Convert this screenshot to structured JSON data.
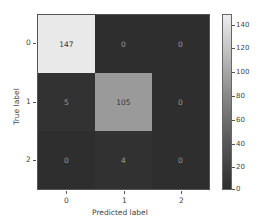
{
  "chart_data": {
    "type": "heatmap",
    "title": "",
    "xlabel": "Predicted label",
    "ylabel": "True label",
    "x_ticks": [
      "0",
      "1",
      "2"
    ],
    "y_ticks": [
      "0",
      "1",
      "2"
    ],
    "matrix": [
      [
        147,
        0,
        0
      ],
      [
        5,
        105,
        0
      ],
      [
        0,
        4,
        0
      ]
    ],
    "colorbar": {
      "min": 0,
      "max": 147,
      "ticks": [
        "0",
        "20",
        "40",
        "60",
        "80",
        "100",
        "120",
        "140"
      ]
    },
    "grid": false
  },
  "cells": [
    {
      "v": "147",
      "bg": "#e9e9e9",
      "fg": "#333333"
    },
    {
      "v": "0",
      "bg": "#2e2e2e",
      "fg": "#9a9a9a"
    },
    {
      "v": "0",
      "bg": "#2e2e2e",
      "fg": "#9a9a9a"
    },
    {
      "v": "5",
      "bg": "#323232",
      "fg": "#9a9a9a"
    },
    {
      "v": "105",
      "bg": "#9a9a9a",
      "fg": "#333333"
    },
    {
      "v": "0",
      "bg": "#2e2e2e",
      "fg": "#9a9a9a"
    },
    {
      "v": "0",
      "bg": "#2e2e2e",
      "fg": "#9a9a9a"
    },
    {
      "v": "4",
      "bg": "#313131",
      "fg": "#9a9a9a"
    },
    {
      "v": "0",
      "bg": "#2e2e2e",
      "fg": "#9a9a9a"
    }
  ]
}
